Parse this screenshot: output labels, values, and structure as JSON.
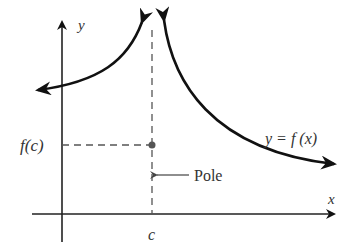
{
  "diagram": {
    "labels": {
      "y_axis": "y",
      "x_axis": "x",
      "fc": "f(c)",
      "c": "c",
      "pole": "Pole",
      "function": "y = f (x)"
    },
    "colors": {
      "curve": "#111111",
      "axis": "#222222",
      "dashed": "#555555",
      "text": "#333333",
      "point": "#555555"
    }
  }
}
